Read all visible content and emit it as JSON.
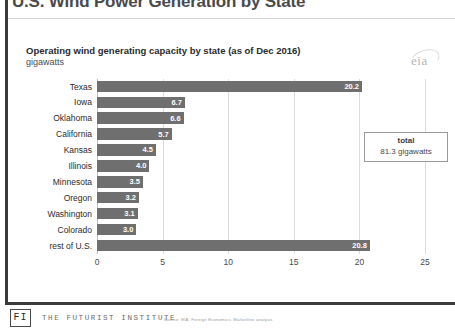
{
  "slide": {
    "title": "U.S. Wind Power Generation by State"
  },
  "chart_header": {
    "subtitle": "Operating wind generating capacity by state (as of Dec 2016)",
    "units": "gigawatts",
    "logo_text": "eia"
  },
  "callout": {
    "label": "total",
    "value": "81.3 gigawatts"
  },
  "footer": {
    "logo_text": "FI",
    "org_name": "THE FUTURIST INSTITUTE",
    "source_note": "Source: EIA, Foreign Economics, Marketline analysis"
  },
  "chart_data": {
    "type": "bar",
    "orientation": "horizontal",
    "title": "Operating wind generating capacity by state (as of Dec 2016)",
    "xlabel": "",
    "ylabel": "",
    "units": "gigawatts",
    "xlim": [
      0,
      25
    ],
    "xticks": [
      0,
      5,
      10,
      15,
      20,
      25
    ],
    "xtick_labels": [
      "0",
      "5",
      "10",
      "15",
      "20",
      "25"
    ],
    "grid": true,
    "legend": false,
    "bar_color": "#6f6f6f",
    "total": 81.3,
    "categories": [
      "Texas",
      "Iowa",
      "Oklahoma",
      "California",
      "Kansas",
      "Illinois",
      "Minnesota",
      "Oregon",
      "Washington",
      "Colorado",
      "rest of U.S."
    ],
    "values": [
      20.2,
      6.7,
      6.6,
      5.7,
      4.5,
      4.0,
      3.5,
      3.2,
      3.1,
      3.0,
      20.8
    ],
    "value_labels": [
      "20.2",
      "6.7",
      "6.6",
      "5.7",
      "4.5",
      "4.0",
      "3.5",
      "3.2",
      "3.1",
      "3.0",
      "20.8"
    ]
  }
}
